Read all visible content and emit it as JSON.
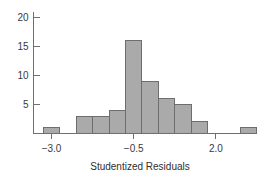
{
  "chart_data": {
    "type": "bar",
    "title": "",
    "subtitle": "",
    "xlabel": "Studentized Residuals",
    "ylabel": "",
    "grid": false,
    "legend": null,
    "xlim": [
      -3.55,
      3.1
    ],
    "ylim": [
      0,
      21
    ],
    "x_ticks": [
      -3.0,
      -0.5,
      2.0
    ],
    "x_tick_labels": [
      "−3.0",
      "−0.5",
      "2.0"
    ],
    "y_ticks": [
      5,
      10,
      15,
      20
    ],
    "y_tick_labels": [
      "5",
      "10",
      "15",
      "20"
    ],
    "bin_width": 0.5,
    "bar_fill_color": "#aaaaaa",
    "bar_edge_color": "#6e6e6e",
    "axis_color": "#6f6f6f",
    "bins": [
      {
        "left": -3.25,
        "right": -2.75,
        "center": -3.0,
        "count": 1
      },
      {
        "left": -2.25,
        "right": -1.75,
        "center": -2.0,
        "count": 3
      },
      {
        "left": -1.75,
        "right": -1.25,
        "center": -1.5,
        "count": 3
      },
      {
        "left": -1.25,
        "right": -0.75,
        "center": -1.0,
        "count": 4
      },
      {
        "left": -0.75,
        "right": -0.25,
        "center": -0.5,
        "count": 16
      },
      {
        "left": -0.25,
        "right": 0.25,
        "center": 0.0,
        "count": 9
      },
      {
        "left": 0.25,
        "right": 0.75,
        "center": 0.5,
        "count": 6
      },
      {
        "left": 0.75,
        "right": 1.25,
        "center": 1.0,
        "count": 5
      },
      {
        "left": 1.25,
        "right": 1.75,
        "center": 1.5,
        "count": 2
      },
      {
        "left": 2.75,
        "right": 3.25,
        "center": 3.0,
        "count": 1
      }
    ],
    "categories": [
      "-3.0",
      "-2.0",
      "-1.5",
      "-1.0",
      "-0.5",
      "0.0",
      "0.5",
      "1.0",
      "1.5",
      "3.0"
    ],
    "values": [
      1,
      3,
      3,
      4,
      16,
      9,
      6,
      5,
      2,
      1
    ]
  }
}
